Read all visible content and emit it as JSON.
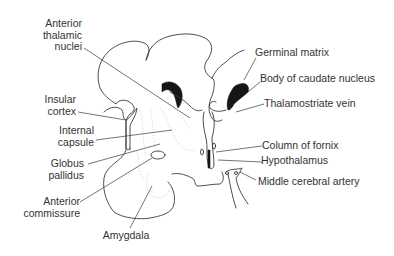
{
  "diagram": {
    "type": "anatomical line drawing",
    "labels_left": [
      {
        "id": "anterior-thalamic-nuclei",
        "lines": [
          "Anterior",
          "thalamic",
          "nuclei"
        ]
      },
      {
        "id": "insular-cortex",
        "lines": [
          "Insular",
          "cortex"
        ]
      },
      {
        "id": "internal-capsule",
        "lines": [
          "Internal",
          "capsule"
        ]
      },
      {
        "id": "globus-pallidus",
        "lines": [
          "Globus",
          "pallidus"
        ]
      },
      {
        "id": "anterior-commissure",
        "lines": [
          "Anterior",
          "commissure"
        ]
      },
      {
        "id": "amygdala",
        "lines": [
          "Amygdala"
        ]
      }
    ],
    "labels_right": [
      {
        "id": "germinal-matrix",
        "text": "Germinal matrix"
      },
      {
        "id": "body-of-caudate-nucleus",
        "text": "Body of caudate nucleus"
      },
      {
        "id": "thalamostriate-vein",
        "text": "Thalamostriate vein"
      },
      {
        "id": "column-of-fornix",
        "text": "Column of fornix"
      },
      {
        "id": "hypothalamus",
        "text": "Hypothalamus"
      },
      {
        "id": "middle-cerebral-artery",
        "text": "Middle cerebral artery"
      }
    ]
  }
}
